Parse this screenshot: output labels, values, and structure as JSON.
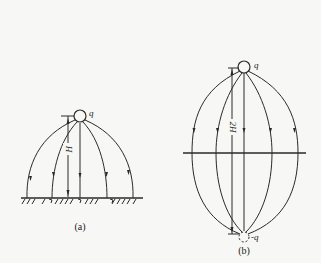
{
  "figure_a": {
    "caption": "(a)",
    "charge_label": "q",
    "height_label": "H",
    "ground": "grounded plane"
  },
  "figure_b": {
    "caption": "(b)",
    "charge_label": "q",
    "image_charge_label": "-q",
    "height_label": "2H",
    "plane": "symmetry plane"
  },
  "colors": {
    "ink": "#2a2a2a",
    "paper": "#f7f7f5"
  }
}
